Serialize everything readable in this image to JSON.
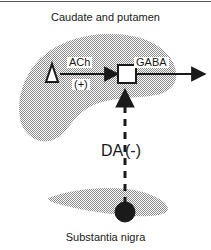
{
  "figure": {
    "title": "Caudate and putamen",
    "caption": "Substantia nigra",
    "width": 211,
    "height": 250,
    "background_color": "#ffffff",
    "ink_color": "#1a1a1a",
    "shading_color": "#a8a8a8",
    "top_rule_color": "#555555"
  },
  "labels": {
    "ach": "ACh",
    "ach_sign": "(+)",
    "gaba": "GABA",
    "da": "DA",
    "da_sign": "(-)"
  },
  "nodes": {
    "cholinergic_interneuron": {
      "shape": "triangle",
      "fill": "#ffffff",
      "stroke": "#1a1a1a"
    },
    "gabaergic_neuron": {
      "shape": "square",
      "fill": "#ffffff",
      "stroke": "#1a1a1a"
    },
    "dopaminergic_neuron": {
      "shape": "circle",
      "fill": "#1a1a1a",
      "stroke": "#1a1a1a"
    }
  },
  "regions": {
    "caudate_putamen": {
      "name": "Caudate and putamen",
      "fill": "#a8a8a8"
    },
    "substantia_nigra": {
      "name": "Substantia nigra",
      "fill": "#a8a8a8"
    }
  },
  "connections": {
    "ach_projection": {
      "label": "ACh",
      "sign": "(+)",
      "style": "solid",
      "direction": "triangle-to-square"
    },
    "gaba_projection": {
      "label": "GABA",
      "style": "solid",
      "direction": "square-to-output"
    },
    "da_projection": {
      "label": "DA",
      "sign": "(-)",
      "style": "dashed",
      "direction": "circle-to-square"
    }
  }
}
